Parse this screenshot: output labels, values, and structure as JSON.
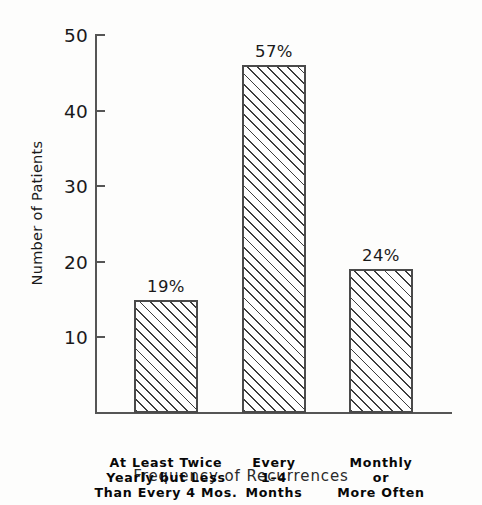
{
  "chart_data": {
    "type": "bar",
    "title": "",
    "xlabel": "Frequency of Recurrences",
    "ylabel": "Number of Patients",
    "categories": [
      "At Least Twice\nYearly but Less\nThan Every 4 Mos.",
      "Every\n1–4\nMonths",
      "Monthly\nor\nMore Often"
    ],
    "values": [
      15,
      46,
      19
    ],
    "data_labels": [
      "19%",
      "57%",
      "24%"
    ],
    "percentages": [
      19,
      57,
      24
    ],
    "ylim": [
      0,
      50
    ],
    "yticks": [
      10,
      20,
      30,
      40,
      50
    ],
    "ytick_labels": [
      "10",
      "20",
      "30",
      "40",
      "50"
    ],
    "grid": false,
    "legend": false,
    "bar_fill": "diagonal-hatch",
    "colors": {
      "bar_border": "#4a4a4a",
      "hatch": "#3d3d3d",
      "bar_background": "#fefefe",
      "axis": "#555555",
      "text": "#1a1a1a",
      "page_background": "#fdfdfc"
    }
  },
  "axes": {
    "y": {
      "title": "Number of Patients",
      "ticks": [
        {
          "label": "50",
          "value": 50
        },
        {
          "label": "40",
          "value": 40
        },
        {
          "label": "30",
          "value": 30
        },
        {
          "label": "20",
          "value": 20
        },
        {
          "label": "10",
          "value": 10
        }
      ]
    },
    "x": {
      "title": "Frequency of Recurrences"
    }
  },
  "bars": [
    {
      "category": "At Least Twice\nYearly but Less\nThan Every 4 Mos.",
      "value": 15,
      "label": "19%"
    },
    {
      "category": "Every\n1–4\nMonths",
      "value": 46,
      "label": "57%"
    },
    {
      "category": "Monthly\nor\nMore Often",
      "value": 19,
      "label": "24%"
    }
  ]
}
